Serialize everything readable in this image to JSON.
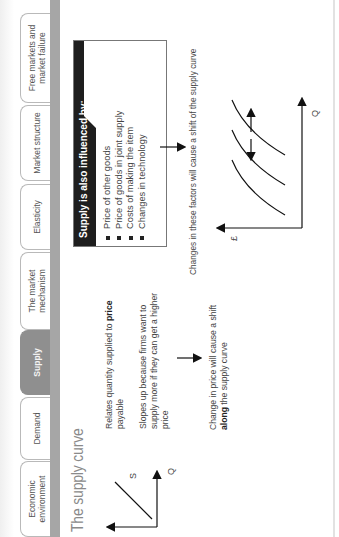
{
  "tabs": [
    {
      "label": "Economic environment",
      "active": false
    },
    {
      "label": "Demand",
      "active": false
    },
    {
      "label": "Supply",
      "active": true
    },
    {
      "label": "The market mechanism",
      "active": false
    },
    {
      "label": "Elasticity",
      "active": false
    },
    {
      "label": "Market structure",
      "active": false
    },
    {
      "label": "Free markets and market failure",
      "active": false
    }
  ],
  "page": {
    "title": "The supply curve",
    "small_graph": {
      "curve_label": "S",
      "x_axis_label": "Q"
    },
    "description": {
      "line1_prefix": "Relates quantity supplied to ",
      "line1_bold": "price",
      "line1_suffix": " payable",
      "line2": "Slopes up because firms want to supply more if they can get a higher price"
    },
    "movement_note": {
      "prefix": "Change in price will cause a shift ",
      "bold": "along",
      "suffix": " the supply curve"
    },
    "influences_box": {
      "heading": "Supply is also influenced by:",
      "items": [
        "Price of other goods",
        "Price of goods in joint supply",
        "Costs of making the item",
        "Changes in technology"
      ]
    },
    "shift_note": "Changes in these factors will cause a shift of the supply curve",
    "shift_graph": {
      "y_axis_label": "£",
      "x_axis_label": "Q"
    }
  }
}
